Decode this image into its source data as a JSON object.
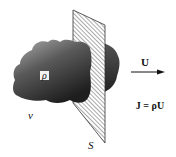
{
  "diagram": {
    "labels": {
      "density": "ρ",
      "volume": "v",
      "surface": "S",
      "velocity": "U",
      "flux_equation": "J = ρU"
    },
    "colors": {
      "cloud_dark": "#2a2a2a",
      "cloud_light": "#9a9a9a",
      "plane_hatch": "#555555",
      "ink": "#111111"
    }
  }
}
